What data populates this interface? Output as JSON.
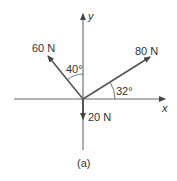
{
  "diagram": {
    "type": "force-vector-diagram",
    "axes": {
      "x_label": "x",
      "y_label": "y"
    },
    "vectors": [
      {
        "name": "force-60n",
        "label": "60 N",
        "magnitude": 60,
        "angle_label": "40°",
        "angle_from": "+y axis toward -x"
      },
      {
        "name": "force-80n",
        "label": "80 N",
        "magnitude": 80,
        "angle_label": "32°",
        "angle_from": "+x axis toward +y"
      },
      {
        "name": "force-20n",
        "label": "20 N",
        "magnitude": 20,
        "direction": "-y"
      }
    ],
    "caption": "(a)",
    "colors": {
      "line": "#555555",
      "text": "#333333",
      "background": "#ffffff"
    }
  }
}
